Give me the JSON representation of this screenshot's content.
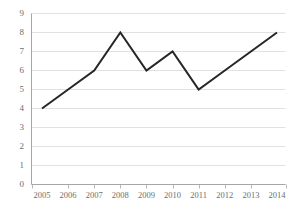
{
  "chart_data": {
    "type": "line",
    "title": "",
    "subtitle": "",
    "xlabel": "",
    "ylabel": "",
    "categories": [
      "2005",
      "2006",
      "2007",
      "2008",
      "2009",
      "2010",
      "2011",
      "2012",
      "2013",
      "2014"
    ],
    "values": [
      4,
      5,
      6,
      8,
      6,
      7,
      5,
      6,
      7,
      8
    ],
    "series": [
      {
        "name": "",
        "values": [
          4,
          5,
          6,
          8,
          6,
          7,
          5,
          6,
          7,
          8
        ]
      }
    ],
    "ylim": [
      0,
      9
    ],
    "yticks": [
      "0",
      "1",
      "2",
      "3",
      "4",
      "5",
      "6",
      "7",
      "8",
      "9"
    ],
    "xticks": [
      "2005",
      "2006",
      "2007",
      "2008",
      "2009",
      "2010",
      "2011",
      "2012",
      "2013",
      "2014"
    ],
    "grid": "horizontal",
    "legend": "none",
    "annotations": [],
    "colors": {
      "line": "#262626",
      "gridline": "#d9d9d9",
      "axis": "#a6a6a6",
      "tick_label": "#6e6e6e",
      "background": "#ffffff"
    }
  }
}
